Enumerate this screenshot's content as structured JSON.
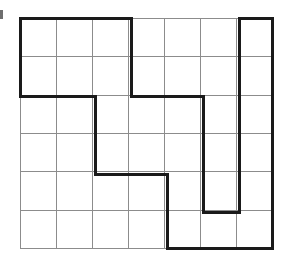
{
  "figure": {
    "background_color": "#ffffff",
    "grid": {
      "columns": 7,
      "rows": 6,
      "cell_width": 36,
      "cell_height": 38.3,
      "origin_x": 20,
      "origin_y": 18,
      "line_color": "#8c8c8c",
      "line_width": 1,
      "x_positions": [
        20,
        56,
        92,
        128,
        164,
        200,
        236,
        272
      ],
      "y_positions": [
        18,
        56,
        95,
        133,
        171,
        210,
        248
      ]
    },
    "outline": {
      "color": "#1a1a1a",
      "line_width": 3,
      "closed": true,
      "vertices_px": [
        [
          20,
          18
        ],
        [
          131,
          18
        ],
        [
          131,
          96
        ],
        [
          203,
          96
        ],
        [
          203,
          212
        ],
        [
          239,
          212
        ],
        [
          239,
          18
        ],
        [
          272,
          18
        ],
        [
          272,
          248
        ],
        [
          167,
          248
        ],
        [
          167,
          174
        ],
        [
          95,
          174
        ],
        [
          95,
          96
        ],
        [
          20,
          96
        ]
      ],
      "vertices_cells": [
        [
          0,
          0
        ],
        [
          3,
          0
        ],
        [
          3,
          2
        ],
        [
          5,
          2
        ],
        [
          5,
          5
        ],
        [
          6,
          5
        ],
        [
          6,
          0
        ],
        [
          7,
          0
        ],
        [
          7,
          6
        ],
        [
          4,
          6
        ],
        [
          4,
          4
        ],
        [
          2,
          4
        ],
        [
          2,
          2
        ],
        [
          0,
          2
        ]
      ]
    },
    "left_edge_mark": {
      "present": true,
      "x": 0,
      "y": 10,
      "width": 3,
      "height": 9,
      "color": "#6e6e6e"
    }
  }
}
